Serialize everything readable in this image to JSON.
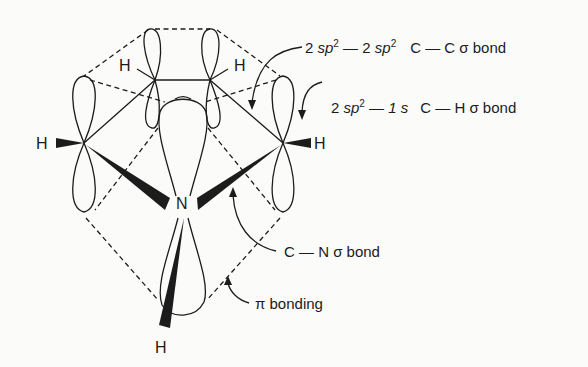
{
  "diagram": {
    "type": "orbital-bonding-diagram",
    "atoms": {
      "h_top_left": "H",
      "h_top_right": "H",
      "h_left": "H",
      "h_right": "H",
      "nitrogen": "N",
      "h_bottom": "H"
    },
    "labels": {
      "cc_bond": {
        "orb1_pre": "2 ",
        "orb1_it": "sp",
        "orb1_sup": "2",
        "dash": " — ",
        "orb2_pre": "2 ",
        "orb2_it": "sp",
        "orb2_sup": "2",
        "bond": "C — C  σ bond"
      },
      "ch_bond": {
        "orb1_pre": "2 ",
        "orb1_it": "sp",
        "orb1_sup": "2",
        "dash": " — ",
        "orb2": "1 s",
        "bond": "C — H  σ bond"
      },
      "cn_bond": "C — N  σ bond",
      "pi_bonding": "π bonding"
    },
    "colors": {
      "ink": "#1c1c1c",
      "background": "#fbfbfa"
    }
  }
}
